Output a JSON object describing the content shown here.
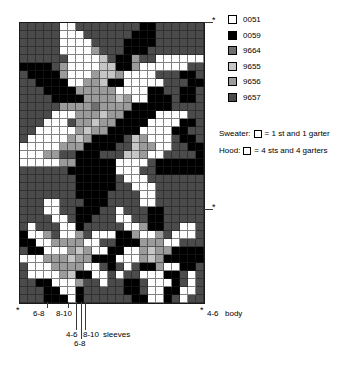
{
  "palette": {
    "W": "#ffffff",
    "K": "#000000",
    "D": "#6f6f6f",
    "L": "#c6c6c6",
    "M": "#9b9b9b",
    "G": "#4b4b4b"
  },
  "legend": [
    {
      "code": "0051",
      "key": "W"
    },
    {
      "code": "0059",
      "key": "K"
    },
    {
      "code": "9664",
      "key": "D"
    },
    {
      "code": "9655",
      "key": "L"
    },
    {
      "code": "9656",
      "key": "M"
    },
    {
      "code": "9657",
      "key": "G"
    }
  ],
  "notes": {
    "sweater_label": "Sweater:",
    "sweater_text": "= 1 st and 1 garter",
    "hood_label": "Hood:",
    "hood_text": "= 4 sts and 4 garters"
  },
  "markers": {
    "top_right": "*",
    "mid_right": "*",
    "bottom_left": "*",
    "bottom_right": "*"
  },
  "size_labels": {
    "left1": "6-8",
    "left2": "8-10",
    "sleeve1": "4-6",
    "sleeve2": "8-10",
    "sleeve3": "6-8",
    "sleeves_word": "sleeves",
    "body_size": "4-6",
    "body_word": "body"
  },
  "chart_data": {
    "type": "heatmap",
    "columns": 23,
    "rows": 35,
    "cell_px": 8,
    "legend_codes": [
      "0051",
      "0059",
      "9664",
      "9655",
      "9656",
      "9657"
    ],
    "grid": [
      "GGGGGWWGGGGGGGGKKGGGGGG",
      "GGGGGWWWGGGGGGKKKGGGGGG",
      "GGGGGWWWWGGGGKKKKGGGGGG",
      "GGGGGWWWWMGGGKKKGGGGGGG",
      "GGGGGGWWWWLGKKMGGWWWWWW",
      "KKKKGMWWWWLLKKMWWWWWWGG",
      "GKKKKMWWWMLLMWWWWGGGKKG",
      "GGKKKKWWMMLKKWWWWWGGGKK",
      "GGGKKKKMMMMMWWWWKKGGKKG",
      "GGGGKKKKMMMMLMWWKKKGKKG",
      "GGGGGMMMMDMMMMKKKKKGGGG",
      "GGGGWWWMMMLMMKKKKWWWWGG",
      "GGGWWWGMMLMMKKKKWWWWKKG",
      "GGWWWWWMLMMKKKKWWWWKKGG",
      "GWWWWWMLMKKKKGLMWWWGKKG",
      "WWWWWMMMKKKKGGLMMWWGGKK",
      "WWWMMGGKKKGGGLLMWWGGGGK",
      "WWWWWMMKKKKKWWWWGKKKKKK",
      "GGGGGGKKKKKKWWWGGKKKKKK",
      "GGGGGGGKKKKKGWWWGGGGGGG",
      "GGGGGGGKKKKKGGWWWGGGGGG",
      "GGGGGGGKKKKGGGGWWGGGGGG",
      "GGGWWGGGKKKGGGGWWGGGGGG",
      "GGGWWGGKKKGGWGGGKKGGGGG",
      "GGGGWWGKKGGGWWGGKKGGGGG",
      "GWGGGWWKGGGGGWWMKKGGWWG",
      "KWWMGWWMGWWWKKMWWMGWWWG",
      "KKWWMMMMWWGGKKKMMMWWGGG",
      "GKKWWWMLMWWKKWWMLMMKKKK",
      "WWWMMMLMMKKKWWWMLMKKKKK",
      "GWWWMMMMWWGKGWGKKMWWKKG",
      "GWWWWMLKKWWGWGGWWWKKGWG",
      "GGKKWWWMGGWGGKKGWWWKGWG",
      "GGGKKWWKGGGGGKKGWWKKWWG",
      "GGGKKKWKGGGGGGKKWWKGWGG"
    ]
  }
}
